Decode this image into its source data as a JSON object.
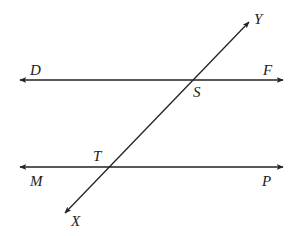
{
  "diagram": {
    "type": "geometry-parallel-lines-transversal",
    "colors": {
      "stroke": "#222222",
      "label": "#1a1a1a",
      "background": "#ffffff"
    },
    "lines": [
      {
        "id": "line-DF",
        "x1": 20,
        "y1": 80,
        "x2": 283,
        "y2": 80,
        "arrows": "both"
      },
      {
        "id": "line-MP",
        "x1": 20,
        "y1": 167,
        "x2": 283,
        "y2": 167,
        "arrows": "both"
      },
      {
        "id": "line-XY",
        "x1": 65,
        "y1": 213,
        "x2": 249,
        "y2": 22,
        "arrows": "both"
      }
    ],
    "points": [
      {
        "id": "S",
        "x": 192,
        "y": 80
      },
      {
        "id": "T",
        "x": 107,
        "y": 167
      }
    ],
    "labels": {
      "D": "D",
      "F": "F",
      "S": "S",
      "Y": "Y",
      "T": "T",
      "M": "M",
      "P": "P",
      "X": "X"
    }
  }
}
